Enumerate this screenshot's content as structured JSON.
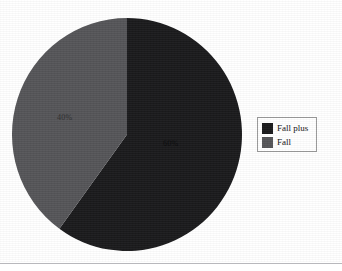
{
  "figure": {
    "background_color": "#ffffff",
    "bottom_rule_color": "#b8b8bc"
  },
  "legend": {
    "position": "right",
    "border_color": "#9a9a9a",
    "background_color": "#ffffff",
    "entries": [
      {
        "label": "Fall plus",
        "color": "#1a1a1c"
      },
      {
        "label": "Fall",
        "color": "#555558"
      }
    ]
  },
  "labels": {
    "fall_plus_pct": "60%",
    "fall_pct": "40%"
  },
  "chart_data": {
    "type": "pie",
    "title": "",
    "subtitle": "",
    "xlabel": "",
    "ylabel": "",
    "grid": false,
    "legend_position": "right",
    "start_angle_deg": 0,
    "direction": "clockwise",
    "categories": [
      "Fall plus",
      "Fall"
    ],
    "values": [
      60,
      40
    ],
    "value_unit": "percent",
    "data_labels": [
      "60%",
      "40%"
    ],
    "colors": [
      "#1a1a1c",
      "#555558"
    ],
    "slices": [
      {
        "name": "Fall plus",
        "value": 60,
        "label": "60%",
        "color": "#1a1a1c"
      },
      {
        "name": "Fall",
        "value": 40,
        "label": "40%",
        "color": "#555558"
      }
    ]
  }
}
